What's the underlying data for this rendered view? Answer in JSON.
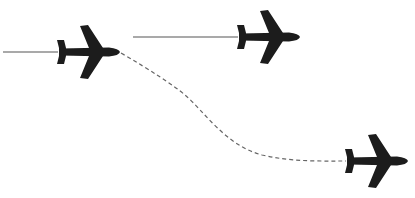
{
  "diagram": {
    "title": "",
    "colors": {
      "background": "#ffffff",
      "plane": "#1c1c1c",
      "solid_trail": "#555555",
      "dashed_path": "#666666"
    },
    "planes": [
      {
        "id": "plane-1",
        "tail_x": 57,
        "nose_x": 120,
        "center_y": 52
      },
      {
        "id": "plane-2",
        "tail_x": 237,
        "nose_x": 298,
        "center_y": 37
      },
      {
        "id": "plane-3",
        "tail_x": 346,
        "nose_x": 406,
        "center_y": 161
      }
    ],
    "trails": [
      {
        "id": "trail-1",
        "style": "solid",
        "from": [
          3,
          52
        ],
        "to": [
          58,
          52
        ]
      },
      {
        "id": "trail-2",
        "style": "solid",
        "from": [
          133,
          37
        ],
        "to": [
          238,
          37
        ]
      },
      {
        "id": "diverging-path",
        "style": "dashed",
        "path": "M121,53 C150,70 175,85 185,95 C205,115 225,145 260,155 C290,162 320,161 346,161"
      }
    ]
  }
}
